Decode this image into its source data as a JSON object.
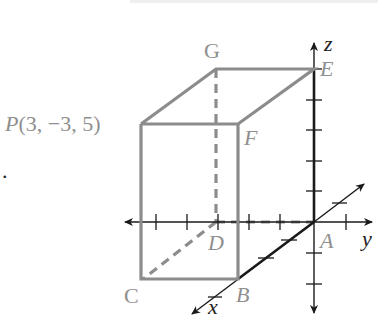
{
  "diagram": {
    "title": "",
    "points": {
      "P": {
        "label": "P(3, −3, 5)",
        "name": "P",
        "coords": "(3, −3, 5)"
      },
      "G": {
        "label": "G"
      },
      "E": {
        "label": "E"
      },
      "F": {
        "label": "F"
      },
      "D": {
        "label": "D"
      },
      "A": {
        "label": "A"
      },
      "B": {
        "label": "B"
      },
      "C": {
        "label": "C"
      }
    },
    "axes": {
      "x": {
        "label": "x"
      },
      "y": {
        "label": "y"
      },
      "z": {
        "label": "z"
      }
    },
    "colors": {
      "box_edges": "#8c8c8c",
      "axes": "#1a1a1a",
      "labels": "#8f8f8f"
    },
    "bullet": "."
  }
}
